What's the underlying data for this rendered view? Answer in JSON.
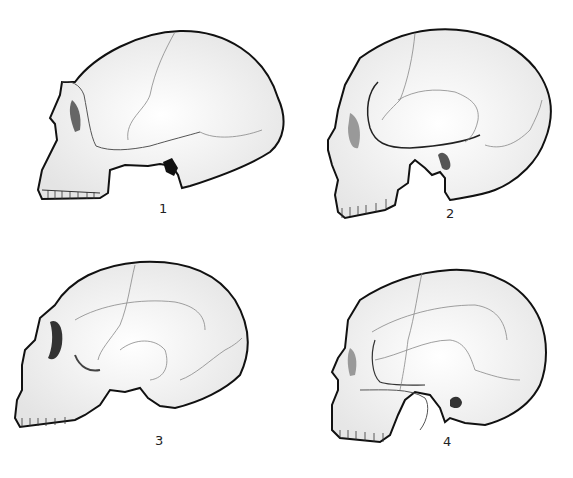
{
  "figures": [
    {
      "id": 1,
      "label": "1",
      "description": "Lateral view of skull with low long vault and prominent brow ridge"
    },
    {
      "id": 2,
      "label": "2",
      "description": "Lateral view of skull with high rounded vault"
    },
    {
      "id": 3,
      "label": "3",
      "description": "Lateral view of skull with long low vault and large orbit"
    },
    {
      "id": 4,
      "label": "4",
      "description": "Lateral view of skull with high rounded vault, modern form"
    }
  ],
  "colors": {
    "line": "#111111",
    "suture": "#777777",
    "shade": "#bbbbbb",
    "background": "#ffffff"
  }
}
